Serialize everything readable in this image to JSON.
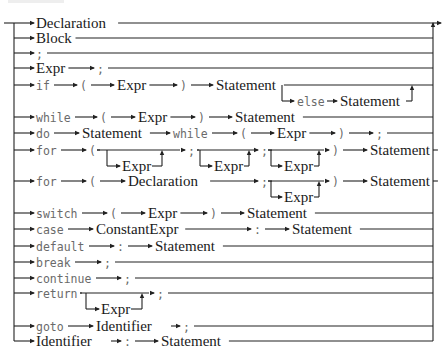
{
  "diagram": {
    "colors": {
      "line": "#222222",
      "nonterminal": "#1a1a1a",
      "keyword": "#6a6a6a"
    },
    "rows": [
      {
        "id": "declaration",
        "y": 23,
        "tokens": [
          {
            "t": "nt",
            "text": "Declaration",
            "x": 36
          }
        ]
      },
      {
        "id": "block",
        "y": 38,
        "tokens": [
          {
            "t": "nt",
            "text": "Block",
            "x": 36
          }
        ]
      },
      {
        "id": "empty",
        "y": 53,
        "tokens": [
          {
            "t": "kw",
            "text": ";",
            "x": 36
          }
        ]
      },
      {
        "id": "expr-stmt",
        "y": 68,
        "tokens": [
          {
            "t": "nt",
            "text": "Expr",
            "x": 36
          },
          {
            "t": "kw",
            "text": ";",
            "x": 97
          }
        ]
      },
      {
        "id": "if",
        "y": 85,
        "tokens": [
          {
            "t": "kw",
            "text": "if",
            "x": 36
          },
          {
            "t": "kw",
            "text": "(",
            "x": 80
          },
          {
            "t": "nt",
            "text": "Expr",
            "x": 117
          },
          {
            "t": "kw",
            "text": ")",
            "x": 180
          },
          {
            "t": "nt",
            "text": "Statement",
            "x": 216
          }
        ],
        "else_branch": {
          "y": 101,
          "kw": "else",
          "nt": "Statement",
          "split_x": 282,
          "kw_x": 297,
          "nt_x": 340,
          "join_x": 412
        }
      },
      {
        "id": "while",
        "y": 117,
        "tokens": [
          {
            "t": "kw",
            "text": "while",
            "x": 36
          },
          {
            "t": "kw",
            "text": "(",
            "x": 100
          },
          {
            "t": "nt",
            "text": "Expr",
            "x": 138
          },
          {
            "t": "kw",
            "text": ")",
            "x": 198
          },
          {
            "t": "nt",
            "text": "Statement",
            "x": 235
          }
        ]
      },
      {
        "id": "do",
        "y": 133,
        "tokens": [
          {
            "t": "kw",
            "text": "do",
            "x": 36
          },
          {
            "t": "nt",
            "text": "Statement",
            "x": 82
          },
          {
            "t": "kw",
            "text": "while",
            "x": 173
          },
          {
            "t": "kw",
            "text": "(",
            "x": 240
          },
          {
            "t": "nt",
            "text": "Expr",
            "x": 277
          },
          {
            "t": "kw",
            "text": ")",
            "x": 338
          },
          {
            "t": "kw",
            "text": ";",
            "x": 376
          }
        ]
      },
      {
        "id": "for-expr",
        "y": 150,
        "tokens": [
          {
            "t": "kw",
            "text": "for",
            "x": 36
          },
          {
            "t": "kw",
            "text": "(",
            "x": 89
          },
          {
            "t": "kw",
            "text": ";",
            "x": 188
          },
          {
            "t": "kw",
            "text": ";",
            "x": 261
          },
          {
            "t": "kw",
            "text": ")",
            "x": 332
          },
          {
            "t": "nt",
            "text": "Statement",
            "x": 370
          }
        ],
        "optionals": [
          {
            "x1": 97,
            "x2": 181,
            "bx": 107,
            "ux": 162,
            "label": "Expr",
            "lx": 122
          },
          {
            "x1": 197,
            "x2": 255,
            "bx": 200,
            "ux": 249,
            "label": "Expr",
            "lx": 214
          },
          {
            "x1": 268,
            "x2": 325,
            "bx": 271,
            "ux": 319,
            "label": "Expr",
            "lx": 284
          }
        ]
      },
      {
        "id": "for-decl",
        "y": 181,
        "tokens": [
          {
            "t": "kw",
            "text": "for",
            "x": 36
          },
          {
            "t": "kw",
            "text": "(",
            "x": 89
          },
          {
            "t": "nt",
            "text": "Declaration",
            "x": 128
          },
          {
            "t": "kw",
            "text": ";",
            "x": 261
          },
          {
            "t": "kw",
            "text": ")",
            "x": 332
          },
          {
            "t": "nt",
            "text": "Statement",
            "x": 370
          }
        ],
        "optionals": [
          {
            "x1": 197,
            "x2": 255,
            "bx": 200,
            "ux": 249,
            "label": "Expr",
            "lx": 214
          },
          {
            "x1": 268,
            "x2": 325,
            "bx": 271,
            "ux": 319,
            "label": "Expr",
            "lx": 284
          }
        ]
      },
      {
        "id": "switch",
        "y": 213,
        "tokens": [
          {
            "t": "kw",
            "text": "switch",
            "x": 36
          },
          {
            "t": "kw",
            "text": "(",
            "x": 110
          },
          {
            "t": "nt",
            "text": "Expr",
            "x": 148
          },
          {
            "t": "kw",
            "text": ")",
            "x": 210
          },
          {
            "t": "nt",
            "text": "Statement",
            "x": 247
          }
        ]
      },
      {
        "id": "case",
        "y": 229,
        "tokens": [
          {
            "t": "kw",
            "text": "case",
            "x": 36
          },
          {
            "t": "nt",
            "text": "ConstantExpr",
            "x": 96
          },
          {
            "t": "kw",
            "text": ":",
            "x": 254
          },
          {
            "t": "nt",
            "text": "Statement",
            "x": 292
          }
        ]
      },
      {
        "id": "default",
        "y": 246,
        "tokens": [
          {
            "t": "kw",
            "text": "default",
            "x": 36
          },
          {
            "t": "kw",
            "text": ":",
            "x": 117
          },
          {
            "t": "nt",
            "text": "Statement",
            "x": 155
          }
        ]
      },
      {
        "id": "break",
        "y": 262,
        "tokens": [
          {
            "t": "kw",
            "text": "break",
            "x": 36
          },
          {
            "t": "kw",
            "text": ";",
            "x": 104
          }
        ]
      },
      {
        "id": "continue",
        "y": 278,
        "tokens": [
          {
            "t": "kw",
            "text": "continue",
            "x": 36
          },
          {
            "t": "kw",
            "text": ";",
            "x": 124
          }
        ]
      },
      {
        "id": "return",
        "y": 293,
        "tokens": [
          {
            "t": "kw",
            "text": "return",
            "x": 36
          },
          {
            "t": "kw",
            "text": ";",
            "x": 157
          }
        ],
        "optionals": [
          {
            "x1": 80,
            "x2": 150,
            "bx": 86,
            "ux": 142,
            "label": "Expr",
            "lx": 101
          }
        ]
      },
      {
        "id": "goto",
        "y": 326,
        "tokens": [
          {
            "t": "kw",
            "text": "goto",
            "x": 36
          },
          {
            "t": "nt",
            "text": "Identifier",
            "x": 96
          },
          {
            "t": "kw",
            "text": ";",
            "x": 183
          }
        ]
      },
      {
        "id": "label",
        "y": 341,
        "tokens": [
          {
            "t": "nt",
            "text": "Identifier",
            "x": 36
          },
          {
            "t": "kw",
            "text": ":",
            "x": 124
          },
          {
            "t": "nt",
            "text": "Statement",
            "x": 161
          }
        ]
      }
    ]
  }
}
